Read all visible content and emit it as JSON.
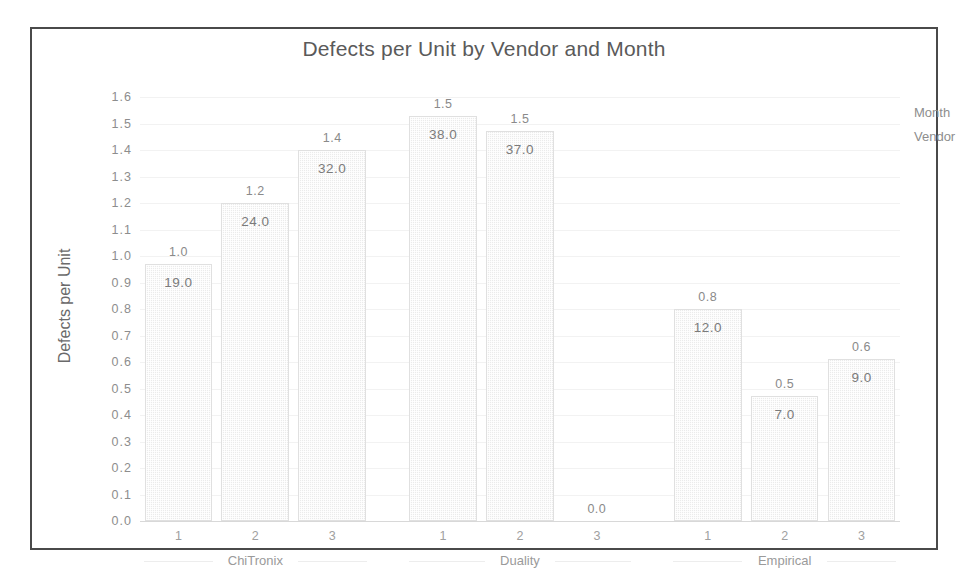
{
  "chart_data": {
    "type": "bar",
    "title": "Defects per Unit by Vendor and Month",
    "xlabel": "Month",
    "ylabel": "Defects per Unit",
    "grouping_label": "Vendor",
    "ylim": [
      0.0,
      1.6
    ],
    "ytick_labels": [
      "1.6",
      "1.5",
      "1.4",
      "1.3",
      "1.2",
      "1.1",
      "1.0",
      "0.9",
      "0.8",
      "0.7",
      "0.6",
      "0.5",
      "0.4",
      "0.3",
      "0.2",
      "0.1",
      "0.0"
    ],
    "ytick_values": [
      1.6,
      1.5,
      1.4,
      1.3,
      1.2,
      1.1,
      1.0,
      0.9,
      0.8,
      0.7,
      0.6,
      0.5,
      0.4,
      0.3,
      0.2,
      0.1,
      0.0
    ],
    "grid": true,
    "legend": "none",
    "categories": [
      "1",
      "2",
      "3"
    ],
    "groups": [
      "ChiTronix",
      "Duality",
      "Empirical"
    ],
    "bars": [
      {
        "vendor": "ChiTronix",
        "month": "1",
        "value": 0.97,
        "value_label": "1.0",
        "count_label": "19.0"
      },
      {
        "vendor": "ChiTronix",
        "month": "2",
        "value": 1.2,
        "value_label": "1.2",
        "count_label": "24.0"
      },
      {
        "vendor": "ChiTronix",
        "month": "3",
        "value": 1.4,
        "value_label": "1.4",
        "count_label": "32.0"
      },
      {
        "vendor": "Duality",
        "month": "1",
        "value": 1.53,
        "value_label": "1.5",
        "count_label": "38.0"
      },
      {
        "vendor": "Duality",
        "month": "2",
        "value": 1.47,
        "value_label": "1.5",
        "count_label": "37.0"
      },
      {
        "vendor": "Duality",
        "month": "3",
        "value": 0.0,
        "value_label": "0.0",
        "count_label": ""
      },
      {
        "vendor": "Empirical",
        "month": "1",
        "value": 0.8,
        "value_label": "0.8",
        "count_label": "12.0"
      },
      {
        "vendor": "Empirical",
        "month": "2",
        "value": 0.47,
        "value_label": "0.5",
        "count_label": "7.0"
      },
      {
        "vendor": "Empirical",
        "month": "3",
        "value": 0.61,
        "value_label": "0.6",
        "count_label": "9.0"
      }
    ],
    "colors": {
      "bar_fill": "#ebebeb",
      "bar_border": "#e0e0e0",
      "frame": "#4a4a4a",
      "text": "#5a5a5a",
      "tick_text": "#8d8d8d",
      "gridline": "#f2f2f2",
      "background": "#ffffff"
    }
  }
}
